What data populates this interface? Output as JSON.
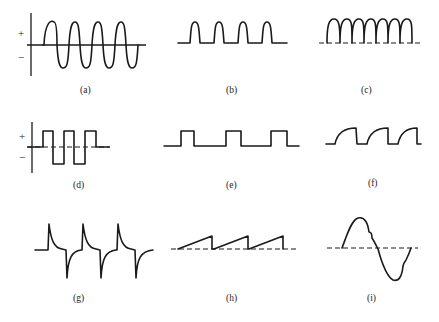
{
  "figure": {
    "panels": [
      {
        "id": "a",
        "label": "(a)",
        "description": "sine-like wave with axes",
        "plus": "+",
        "minus": "−"
      },
      {
        "id": "b",
        "label": "(b)",
        "description": "rounded positive pulses"
      },
      {
        "id": "c",
        "label": "(c)",
        "description": "full-wave rectified arches"
      },
      {
        "id": "d",
        "label": "(d)",
        "description": "bipolar square wave with axes",
        "plus": "+",
        "minus": "−"
      },
      {
        "id": "e",
        "label": "(e)",
        "description": "rectangular pulse train"
      },
      {
        "id": "f",
        "label": "(f)",
        "description": "exponentially rising pulses"
      },
      {
        "id": "g",
        "label": "(g)",
        "description": "differentiated spikes"
      },
      {
        "id": "h",
        "label": "(h)",
        "description": "sawtooth wave"
      },
      {
        "id": "i",
        "label": "(i)",
        "description": "distorted sine cycle"
      }
    ]
  }
}
